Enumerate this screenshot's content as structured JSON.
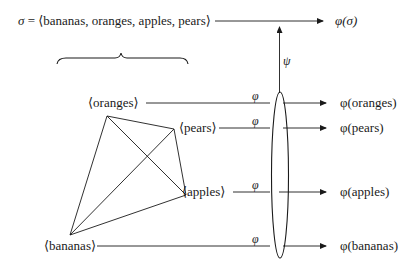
{
  "top": {
    "sigma_symbol": "σ",
    "sigma_eq": " = ⟨bananas, oranges, apples, pears⟩",
    "result": "φ(σ)"
  },
  "psi_label": "ψ",
  "map_label": "φ",
  "nodes": [
    {
      "name": "oranges",
      "label": "⟨oranges⟩",
      "result": "φ(oranges)"
    },
    {
      "name": "pears",
      "label": "⟨pears⟩",
      "result": "φ(pears)"
    },
    {
      "name": "apples",
      "label": "⟨apples⟩",
      "result": "φ(apples)"
    },
    {
      "name": "bananas",
      "label": "⟨bananas⟩",
      "result": "φ(bananas)"
    }
  ],
  "colors": {
    "ink": "#1a1a1a",
    "background": "#ffffff"
  }
}
